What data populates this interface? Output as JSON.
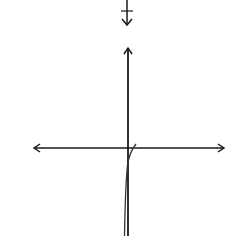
{
  "top_graph_fragment": {
    "partial_label": "6",
    "axis_arrow": "down"
  },
  "option_label": "C)",
  "chart_data": {
    "type": "line",
    "title": "",
    "xlabel": "x",
    "ylabel": "y",
    "xlim": [
      -8,
      8
    ],
    "ylim": [
      -8,
      8
    ],
    "grid": "dotted",
    "x_tick_labels": [
      "-6",
      "-4",
      "-2",
      "2",
      "4",
      "6"
    ],
    "y_tick_labels": [
      "6",
      "4",
      "2",
      "-2",
      "-4",
      "-6"
    ],
    "series": [
      {
        "name": "curve",
        "x": [
          0.6,
          0.3,
          0.0,
          -0.15,
          -0.25,
          -0.3
        ],
        "y": [
          0.3,
          -0.3,
          -1.2,
          -3.0,
          -5.5,
          -7.5
        ]
      }
    ]
  },
  "colors": {
    "axis": "#1a1a1a",
    "grid_dot": "#9a9a9a",
    "curve": "#333333"
  }
}
